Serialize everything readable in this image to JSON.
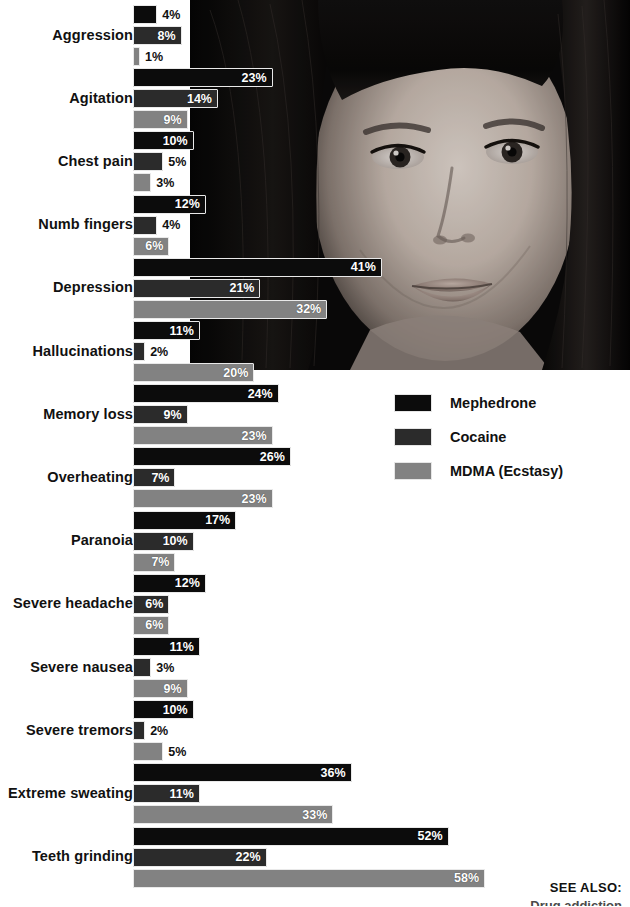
{
  "chart_data": {
    "type": "bar",
    "orientation": "horizontal",
    "title": "",
    "xlabel": "",
    "ylabel": "",
    "value_suffix": "%",
    "xlim": [
      0,
      58
    ],
    "grid": false,
    "legend_position": "right-middle",
    "categories": [
      "Aggression",
      "Agitation",
      "Chest pain",
      "Numb fingers",
      "Depression",
      "Hallucinations",
      "Memory loss",
      "Overheating",
      "Paranoia",
      "Severe headache",
      "Severe nausea",
      "Severe tremors",
      "Extreme sweating",
      "Teeth grinding"
    ],
    "series": [
      {
        "name": "Mephedrone",
        "color": "#0c0c0c",
        "values": [
          4,
          23,
          10,
          12,
          41,
          11,
          24,
          26,
          17,
          12,
          11,
          10,
          36,
          52
        ],
        "labels": [
          "4%",
          "23%",
          "10%",
          "12%",
          "41%",
          "11%",
          "24%",
          "26%",
          "17%",
          "12%",
          "11%",
          "10%",
          "36%",
          "52%"
        ]
      },
      {
        "name": "Cocaine",
        "color": "#2b2b2b",
        "values": [
          8,
          14,
          5,
          4,
          21,
          2,
          9,
          7,
          10,
          6,
          3,
          2,
          11,
          22
        ],
        "labels": [
          "8%",
          "14%",
          "5%",
          "4%",
          "21%",
          "2%",
          "9%",
          "7%",
          "10%",
          "6%",
          "3%",
          "2%",
          "11%",
          "22%"
        ]
      },
      {
        "name": "MDMA (Ecstasy)",
        "color": "#828282",
        "values": [
          1,
          9,
          3,
          6,
          32,
          20,
          23,
          23,
          7,
          6,
          9,
          5,
          33,
          58
        ],
        "labels": [
          "1%",
          "9%",
          "3%",
          "6%",
          "32%",
          "20%",
          "23%",
          "23%",
          "7%",
          "6%",
          "9%",
          "5%",
          "33%",
          "58%"
        ]
      }
    ]
  },
  "legend": {
    "items": [
      {
        "label": "Mephedrone",
        "color": "#0c0c0c"
      },
      {
        "label": "Cocaine",
        "color": "#2b2b2b"
      },
      {
        "label": "MDMA (Ecstasy)",
        "color": "#828282"
      }
    ]
  },
  "see_also": {
    "title": "SEE ALSO:",
    "subtitle": "Drug addiction"
  },
  "photo": {
    "alt": "black-and-white portrait photograph of a young woman with fringe looking to the side"
  }
}
